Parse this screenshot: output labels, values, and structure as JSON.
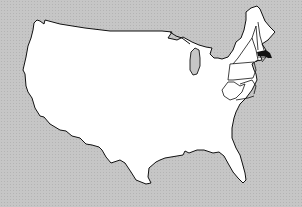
{
  "map": {
    "subject": "Contiguous United States",
    "colors": {
      "background": "#c6c6c6",
      "land": "#ffffff",
      "border": "#111111",
      "highlight": "#111111"
    },
    "highlighted_states": [
      "Massachusetts"
    ],
    "outlined_states": [
      "Maine",
      "New Hampshire",
      "Vermont",
      "Massachusetts",
      "Connecticut",
      "Rhode Island",
      "New York",
      "Pennsylvania",
      "New Jersey",
      "West Virginia",
      "Maryland",
      "Delaware",
      "Virginia"
    ]
  }
}
